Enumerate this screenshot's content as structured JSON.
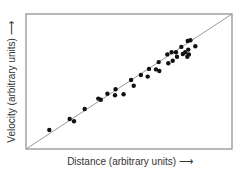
{
  "chart_data": {
    "type": "scatter",
    "title": "",
    "xlabel": "Distance (arbitrary units) ⟶",
    "ylabel": "Velocity (arbitrary units) ⟶",
    "xlim": [
      0,
      100
    ],
    "ylim": [
      0,
      100
    ],
    "grid": false,
    "legend": null,
    "ticks": "none",
    "series": [
      {
        "name": "galaxies",
        "marker": "filled-circle",
        "color": "#111111",
        "points": [
          [
            11.3,
            14.1
          ],
          [
            21.2,
            22.2
          ],
          [
            23.3,
            20.5
          ],
          [
            28.5,
            29.6
          ],
          [
            35.1,
            37.3
          ],
          [
            36.3,
            36.5
          ],
          [
            39.5,
            41.0
          ],
          [
            43.2,
            39.8
          ],
          [
            43.5,
            44.2
          ],
          [
            47.4,
            40.5
          ],
          [
            51.0,
            51.1
          ],
          [
            52.3,
            46.9
          ],
          [
            55.8,
            54.8
          ],
          [
            59.1,
            53.6
          ],
          [
            59.7,
            59.3
          ],
          [
            63.1,
            59.0
          ],
          [
            64.7,
            57.8
          ],
          [
            64.4,
            64.4
          ],
          [
            68.6,
            70.1
          ],
          [
            69.1,
            63.5
          ],
          [
            70.7,
            71.6
          ],
          [
            71.2,
            65.4
          ],
          [
            72.8,
            71.6
          ],
          [
            73.3,
            68.4
          ],
          [
            75.4,
            75.6
          ],
          [
            76.1,
            70.4
          ],
          [
            77.3,
            71.6
          ],
          [
            78.8,
            73.6
          ],
          [
            78.3,
            68.4
          ],
          [
            79.1,
            70.1
          ],
          [
            78.5,
            80.0
          ],
          [
            79.8,
            80.5
          ],
          [
            82.2,
            76.1
          ]
        ]
      }
    ],
    "annotations": [
      {
        "type": "line",
        "name": "fit-line",
        "from": [
          0,
          0
        ],
        "to": [
          100,
          100
        ],
        "color": "#999999"
      }
    ]
  },
  "labels": {
    "x": "Distance (arbitrary units) ⟶",
    "y": "Velocity (arbitrary units) ⟶"
  }
}
